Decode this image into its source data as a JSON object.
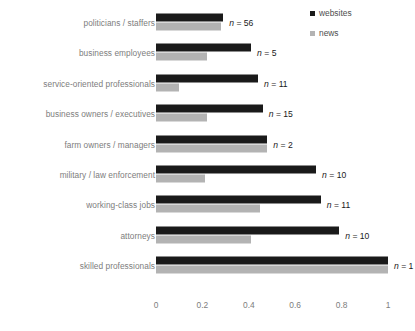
{
  "chart_data": {
    "type": "bar",
    "orientation": "horizontal",
    "title": "",
    "xlabel": "",
    "ylabel": "",
    "xlim": [
      0,
      1
    ],
    "xticks": [
      "0",
      "0.2",
      "0.4",
      "0.6",
      "0.8",
      "1"
    ],
    "xtick_values": [
      0,
      0.2,
      0.4,
      0.6,
      0.8,
      1
    ],
    "grid": false,
    "legend_position": "top-right",
    "categories": [
      "politicians / staffers",
      "business employees",
      "service-oriented professionals",
      "business owners / executives",
      "farm owners / managers",
      "military / law enforcement",
      "working-class jobs",
      "attorneys",
      "skilled professionals"
    ],
    "annotations": [
      "n = 56",
      "n = 5",
      "n = 11",
      "n = 15",
      "n = 2",
      "n = 10",
      "n = 11",
      "n = 10",
      "n = 1"
    ],
    "n_values": [
      56,
      5,
      11,
      15,
      2,
      10,
      11,
      10,
      1
    ],
    "series": [
      {
        "name": "websites",
        "color": "#1a1a1a",
        "values": [
          0.29,
          0.41,
          0.44,
          0.46,
          0.48,
          0.69,
          0.71,
          0.79,
          1.0
        ]
      },
      {
        "name": "news",
        "color": "#b3b3b3",
        "values": [
          0.28,
          0.22,
          0.1,
          0.22,
          0.48,
          0.21,
          0.45,
          0.41,
          1.0
        ]
      }
    ]
  },
  "legend": {
    "items": [
      {
        "label": "websites",
        "swatch": "websites-swatch-icon"
      },
      {
        "label": "news",
        "swatch": "news-swatch-icon"
      }
    ]
  }
}
